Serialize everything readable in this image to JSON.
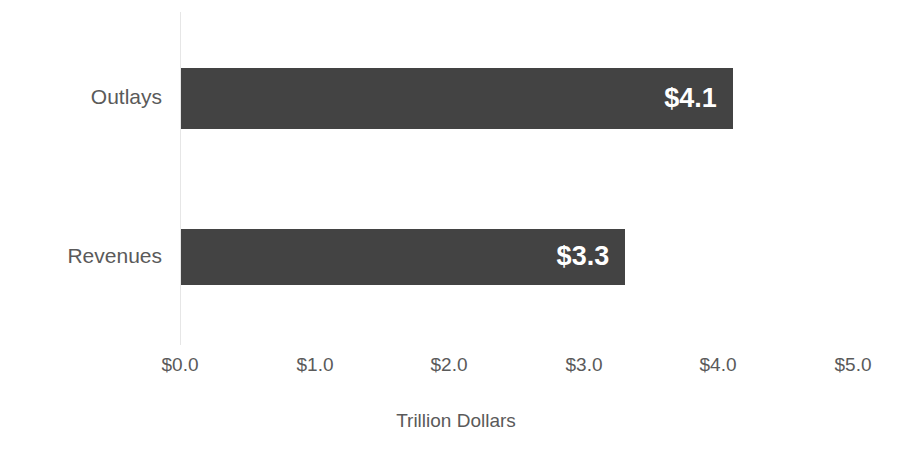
{
  "chart_data": {
    "type": "bar",
    "orientation": "horizontal",
    "title": "",
    "subtitle": "",
    "xlabel": "Trillion Dollars",
    "ylabel": "",
    "categories": [
      "Outlays",
      "Revenues"
    ],
    "values": [
      4.1,
      3.3
    ],
    "data_labels": [
      "$4.1",
      "$3.3"
    ],
    "xlim": [
      0.0,
      5.0
    ],
    "xticks": [
      0.0,
      1.0,
      2.0,
      3.0,
      4.0,
      5.0
    ],
    "xtick_labels": [
      "$0.0",
      "$1.0",
      "$2.0",
      "$3.0",
      "$4.0",
      "$5.0"
    ],
    "grid": false,
    "legend": false,
    "legend_position": "none",
    "series": [
      {
        "name": "",
        "values": [
          4.1,
          3.3
        ]
      }
    ]
  },
  "style": {
    "bar_color": "#434343",
    "text_color": "#5a5a5a",
    "data_label_color": "#ffffff",
    "axis_line_color": "#e6e6e6",
    "background": "#ffffff"
  }
}
